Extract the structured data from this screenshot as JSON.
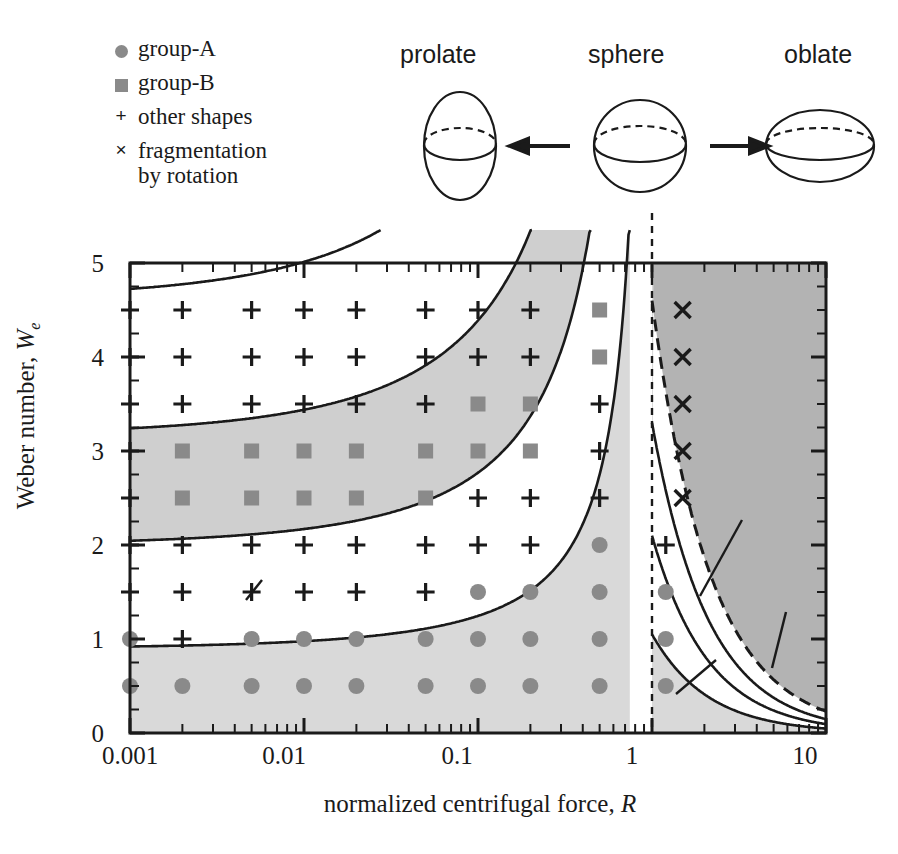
{
  "legend": {
    "items": [
      {
        "symbol": "filled-circle",
        "label": "group-A"
      },
      {
        "symbol": "filled-square",
        "label": "group-B"
      },
      {
        "symbol": "plus",
        "glyph": "+",
        "label": "other shapes"
      },
      {
        "symbol": "cross",
        "glyph": "×",
        "label": "fragmentation",
        "label2": "by rotation"
      }
    ]
  },
  "shapes_diagram": {
    "left_label": "prolate",
    "center_label": "sphere",
    "right_label": "oblate",
    "left_arrow": "←",
    "right_arrow": "→"
  },
  "chart_data": {
    "type": "scatter",
    "title": "",
    "xlabel": "normalized centrifugal force, R",
    "xlabel_plain": "normalized centrifugal force,",
    "xlabel_symbol": "R",
    "ylabel": "Weber number, We",
    "ylabel_plain": "Weber number,",
    "ylabel_symbol": "W",
    "ylabel_sub": "e",
    "xscale": "log",
    "xlim": [
      0.001,
      10
    ],
    "ylim": [
      0,
      5
    ],
    "xticks": [
      0.001,
      0.01,
      0.1,
      1,
      10
    ],
    "xticklabels": [
      "0.001",
      "0.01",
      "0.1",
      "1",
      "10"
    ],
    "yticks": [
      0,
      1,
      2,
      3,
      4,
      5
    ],
    "yticklabels": [
      "0",
      "1",
      "2",
      "3",
      "4",
      "5"
    ],
    "yminor_step": 0.25,
    "grid": false,
    "legend_position": "outside-top-left",
    "series": [
      {
        "name": "group-A",
        "symbol": "filled-circle",
        "color": "#8a8a8a",
        "points": [
          [
            0.001,
            0.5
          ],
          [
            0.002,
            0.5
          ],
          [
            0.005,
            0.5
          ],
          [
            0.01,
            0.5
          ],
          [
            0.02,
            0.5
          ],
          [
            0.05,
            0.5
          ],
          [
            0.1,
            0.5
          ],
          [
            0.2,
            0.5
          ],
          [
            0.5,
            0.5
          ],
          [
            1.2,
            0.5
          ],
          [
            0.001,
            1.0
          ],
          [
            0.005,
            1.0
          ],
          [
            0.01,
            1.0
          ],
          [
            0.02,
            1.0
          ],
          [
            0.05,
            1.0
          ],
          [
            0.1,
            1.0
          ],
          [
            0.2,
            1.0
          ],
          [
            0.5,
            1.0
          ],
          [
            1.2,
            1.0
          ],
          [
            0.1,
            1.5
          ],
          [
            0.2,
            1.5
          ],
          [
            0.5,
            1.5
          ],
          [
            1.2,
            1.5
          ],
          [
            0.5,
            2.0
          ]
        ]
      },
      {
        "name": "group-B",
        "symbol": "filled-square",
        "color": "#8a8a8a",
        "points": [
          [
            0.002,
            2.5
          ],
          [
            0.005,
            2.5
          ],
          [
            0.01,
            2.5
          ],
          [
            0.02,
            2.5
          ],
          [
            0.05,
            2.5
          ],
          [
            0.002,
            3.0
          ],
          [
            0.005,
            3.0
          ],
          [
            0.01,
            3.0
          ],
          [
            0.02,
            3.0
          ],
          [
            0.05,
            3.0
          ],
          [
            0.1,
            3.0
          ],
          [
            0.2,
            3.0
          ],
          [
            0.1,
            3.5
          ],
          [
            0.2,
            3.5
          ],
          [
            0.5,
            4.0
          ],
          [
            0.5,
            4.5
          ]
        ]
      },
      {
        "name": "other shapes",
        "symbol": "plus",
        "glyph": "+",
        "color": "#1a1a1a",
        "points": [
          [
            0.002,
            1.0
          ],
          [
            0.001,
            1.5
          ],
          [
            0.002,
            1.5
          ],
          [
            0.005,
            1.5
          ],
          [
            0.01,
            1.5
          ],
          [
            0.02,
            1.5
          ],
          [
            0.05,
            1.5
          ],
          [
            0.001,
            2.0
          ],
          [
            0.002,
            2.0
          ],
          [
            0.005,
            2.0
          ],
          [
            0.01,
            2.0
          ],
          [
            0.02,
            2.0
          ],
          [
            0.05,
            2.0
          ],
          [
            0.1,
            2.0
          ],
          [
            0.2,
            2.0
          ],
          [
            1.2,
            2.0
          ],
          [
            0.001,
            2.5
          ],
          [
            0.1,
            2.5
          ],
          [
            0.2,
            2.5
          ],
          [
            0.5,
            2.5
          ],
          [
            0.001,
            3.0
          ],
          [
            0.5,
            3.0
          ],
          [
            0.001,
            3.5
          ],
          [
            0.002,
            3.5
          ],
          [
            0.005,
            3.5
          ],
          [
            0.01,
            3.5
          ],
          [
            0.02,
            3.5
          ],
          [
            0.05,
            3.5
          ],
          [
            0.5,
            3.5
          ],
          [
            0.001,
            4.0
          ],
          [
            0.002,
            4.0
          ],
          [
            0.005,
            4.0
          ],
          [
            0.01,
            4.0
          ],
          [
            0.02,
            4.0
          ],
          [
            0.05,
            4.0
          ],
          [
            0.1,
            4.0
          ],
          [
            0.2,
            4.0
          ],
          [
            0.001,
            4.5
          ],
          [
            0.002,
            4.5
          ],
          [
            0.005,
            4.5
          ],
          [
            0.01,
            4.5
          ],
          [
            0.02,
            4.5
          ],
          [
            0.05,
            4.5
          ],
          [
            0.1,
            4.5
          ],
          [
            0.2,
            4.5
          ]
        ]
      },
      {
        "name": "fragmentation by rotation",
        "symbol": "cross",
        "glyph": "×",
        "color": "#1a1a1a",
        "points": [
          [
            1.5,
            4.5
          ],
          [
            1.5,
            4.0
          ],
          [
            1.5,
            3.5
          ],
          [
            1.5,
            3.0
          ],
          [
            1.5,
            2.5
          ]
        ]
      }
    ],
    "regions": [
      {
        "name": "group-A",
        "label": "group-A",
        "fill": "#d9d9d9",
        "label_x": 0.35,
        "label_y": 0.78
      },
      {
        "name": "group-B",
        "label": "group-B",
        "fill": "#cfcfcf",
        "label_x": 0.045,
        "label_y": 2.82
      },
      {
        "name": "unstable",
        "label": "unstable",
        "fill": "#b3b3b3",
        "label_x": 2.2,
        "label_y": 3.5
      }
    ],
    "contours": [
      {
        "family": "b/a",
        "value": "0.6",
        "label": "0.6",
        "label_x": 0.0075,
        "label_y": 4.28
      },
      {
        "family": "b/a",
        "value": "0.7",
        "label": "0.7",
        "label_x": 0.0075,
        "label_y": 3.28
      },
      {
        "family": "b/a",
        "value": "0.8",
        "label": "0.8",
        "label_x": 0.0075,
        "label_y": 2.22
      },
      {
        "family": "b/a",
        "value": "0.9",
        "label": "b / a = 0.9",
        "label_x": 0.0045,
        "label_y": 1.33,
        "label_parts": {
          "num": "b",
          "sep": "/",
          "den": "a",
          "eq": "=",
          "val": "0.9"
        }
      },
      {
        "family": "c/b",
        "value": "0.8",
        "label": "c / b = 0.8",
        "label_x": 2.4,
        "label_y": 2.1,
        "label_parts": {
          "num": "c",
          "sep": "/",
          "den": "b",
          "eq": "=",
          "val": "0.8"
        }
      },
      {
        "family": "c/b",
        "value": "0.7",
        "label": "0.7",
        "label_x": 5.0,
        "label_y": 1.45
      },
      {
        "family": "c/b",
        "value": "0.9",
        "label": "0.9",
        "label_x": 1.45,
        "label_y": 0.28
      }
    ],
    "annotations": [
      {
        "name": "sphere-line",
        "type": "vertical-dashed",
        "x": 1.0
      },
      {
        "name": "stability-boundary",
        "type": "dashed-curve"
      }
    ],
    "colors": {
      "light_gray": "#d9d9d9",
      "mid_gray": "#cfcfcf",
      "dark_gray": "#b3b3b3",
      "marker_gray": "#8a8a8a",
      "line": "#1a1a1a"
    }
  }
}
